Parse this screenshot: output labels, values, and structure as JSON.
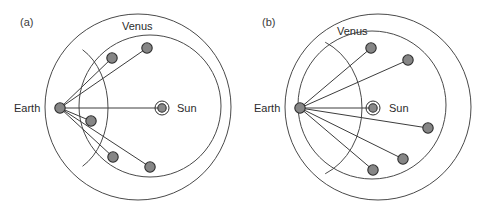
{
  "figure": {
    "width": 479,
    "height": 208,
    "background": "#ffffff",
    "stroke_color": "#4a4a4a",
    "marker_fill": "#868686",
    "marker_stroke": "#2e2e2e",
    "text_color": "#2b2b2b"
  },
  "chart_data": {
    "type": "scatter",
    "title": "",
    "xlabel": "",
    "ylabel": "",
    "panels": [
      {
        "id": "a",
        "label": "(a)",
        "label_x": 20,
        "label_y": 26,
        "outer_circle": {
          "cx": 138,
          "cy": 107,
          "r": 93,
          "name": "earth-orbit-circle"
        },
        "inner_circle": {
          "cx": 150,
          "cy": 106,
          "r": 71,
          "name": "venus-orbit-circle"
        },
        "epicycle_arc": {
          "name": "venus-epicycle-arc",
          "cx": 60,
          "cy": 108,
          "rx": 48,
          "ry": 66,
          "start_deg": -62,
          "end_deg": 62
        },
        "earth": {
          "x": 60,
          "y": 108,
          "r": 5.2,
          "label": "Earth",
          "label_x": 14,
          "label_y": 112
        },
        "sun": {
          "x": 162,
          "y": 108,
          "r_core": 4.2,
          "r_ring": 7.0,
          "label": "Sun",
          "label_x": 177,
          "label_y": 112
        },
        "venus_label": {
          "text": "Venus",
          "x": 122,
          "y": 30
        },
        "venus_positions": [
          {
            "x": 147,
            "y": 48,
            "r": 5.2,
            "name": "venus-position-1"
          },
          {
            "x": 112,
            "y": 58,
            "r": 5.2,
            "name": "venus-position-2"
          },
          {
            "x": 91,
            "y": 121,
            "r": 5.2,
            "name": "venus-position-3"
          },
          {
            "x": 113,
            "y": 157,
            "r": 5.2,
            "name": "venus-position-4"
          },
          {
            "x": 150,
            "y": 167,
            "r": 5.2,
            "name": "venus-position-5"
          }
        ],
        "sight_lines": [
          {
            "from": "earth",
            "to": 0
          },
          {
            "from": "earth",
            "to": 1
          },
          {
            "from": "earth",
            "to": 2
          },
          {
            "from": "earth",
            "to": 3
          },
          {
            "from": "earth",
            "to": 4
          }
        ],
        "sun_line": true
      },
      {
        "id": "b",
        "label": "(b)",
        "label_x": 262,
        "label_y": 26,
        "outer_circle": {
          "cx": 378,
          "cy": 107,
          "r": 93,
          "name": "earth-orbit-circle"
        },
        "inner_circle": {
          "cx": 372,
          "cy": 105,
          "r": 74,
          "name": "venus-orbit-circle"
        },
        "epicycle_arc": {
          "name": "venus-epicycle-arc",
          "cx": 300,
          "cy": 108,
          "rx": 62,
          "ry": 72,
          "start_deg": -66,
          "end_deg": 66
        },
        "earth": {
          "x": 300,
          "y": 108,
          "r": 5.2,
          "label": "Earth",
          "label_x": 254,
          "label_y": 112
        },
        "sun": {
          "x": 373,
          "y": 108,
          "r_core": 4.2,
          "r_ring": 7.0,
          "label": "Sun",
          "label_x": 389,
          "label_y": 112
        },
        "venus_label": {
          "text": "Venus",
          "x": 337,
          "y": 35
        },
        "venus_positions": [
          {
            "x": 371,
            "y": 48,
            "r": 5.2,
            "name": "venus-position-1"
          },
          {
            "x": 408,
            "y": 60,
            "r": 5.2,
            "name": "venus-position-2"
          },
          {
            "x": 428,
            "y": 128,
            "r": 5.2,
            "name": "venus-position-3"
          },
          {
            "x": 403,
            "y": 159,
            "r": 5.2,
            "name": "venus-position-4"
          },
          {
            "x": 373,
            "y": 170,
            "r": 5.2,
            "name": "venus-position-5"
          }
        ],
        "sight_lines": [
          {
            "from": "earth",
            "to": 0
          },
          {
            "from": "earth",
            "to": 1
          },
          {
            "from": "earth",
            "to": 2
          },
          {
            "from": "earth",
            "to": 3
          },
          {
            "from": "earth",
            "to": 4
          }
        ],
        "sun_line": true
      }
    ]
  }
}
